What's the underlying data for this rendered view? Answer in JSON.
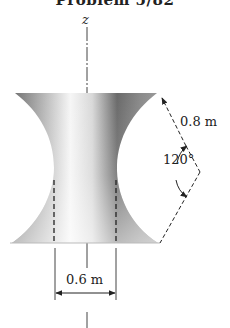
{
  "figure": {
    "title": "Problem 5/82",
    "axis_label": "z",
    "dimensions": {
      "slant_length": "0.8 m",
      "angle": "120°",
      "base_width": "0.6 m"
    },
    "colors": {
      "ink": "#222222",
      "shade_dark": "#5a5a5a",
      "shade_light": "#f4f4f4",
      "background": "#ffffff"
    }
  }
}
